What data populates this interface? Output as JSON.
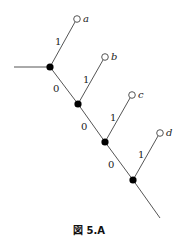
{
  "caption": "図 5.A",
  "nodes": [
    {
      "id": "n1",
      "x": 50,
      "y": 67
    },
    {
      "id": "n2",
      "x": 78,
      "y": 104
    },
    {
      "id": "n3",
      "x": 105,
      "y": 142
    },
    {
      "id": "n4",
      "x": 133,
      "y": 180
    }
  ],
  "leaves": [
    {
      "id": "a",
      "label": "a",
      "x": 77,
      "y": 19
    },
    {
      "id": "b",
      "label": "b",
      "x": 105,
      "y": 57
    },
    {
      "id": "c",
      "label": "c",
      "x": 132,
      "y": 95
    },
    {
      "id": "d",
      "label": "d",
      "x": 160,
      "y": 133
    }
  ],
  "edge_labels": {
    "n1_a": "1",
    "n1_n2": "0",
    "n2_b": "1",
    "n2_n3": "0",
    "n3_c": "1",
    "n3_n4": "0",
    "n4_d": "1"
  },
  "colors": {
    "edge": "#555555",
    "node": "#000000"
  }
}
